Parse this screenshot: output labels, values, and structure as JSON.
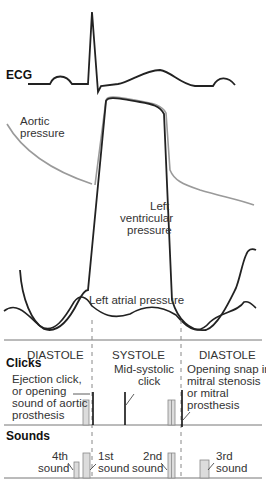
{
  "diagram": {
    "ecg_label": "ECG",
    "aortic_label_line1": "Aortic",
    "aortic_label_line2": "pressure",
    "lv_label_line1": "Left",
    "lv_label_line2": "ventricular",
    "lv_label_line3": "pressure",
    "la_label": "Left atrial pressure",
    "phases": [
      "DIASTOLE",
      "SYSTOLE",
      "DIASTOLE"
    ],
    "clicks": {
      "heading": "Clicks",
      "ejection": [
        "Ejection click,",
        "or opening",
        "sound of aortic",
        "prosthesis"
      ],
      "midsystolic": [
        "Mid-systolic",
        "click"
      ],
      "opening_snap": [
        "Opening snap in",
        "mitral stenosis",
        "or mitral",
        "prosthesis"
      ]
    },
    "sounds": {
      "heading": "Sounds",
      "s4": [
        "4th",
        "sound"
      ],
      "s1": [
        "1st",
        "sound"
      ],
      "s2": [
        "2nd",
        "sound"
      ],
      "s3": [
        "3rd",
        "sound"
      ]
    },
    "colors": {
      "line": "#222222",
      "aortic": "#9a9a9a",
      "bar_fill": "#dcdcdc",
      "dashed": "#888888"
    }
  }
}
